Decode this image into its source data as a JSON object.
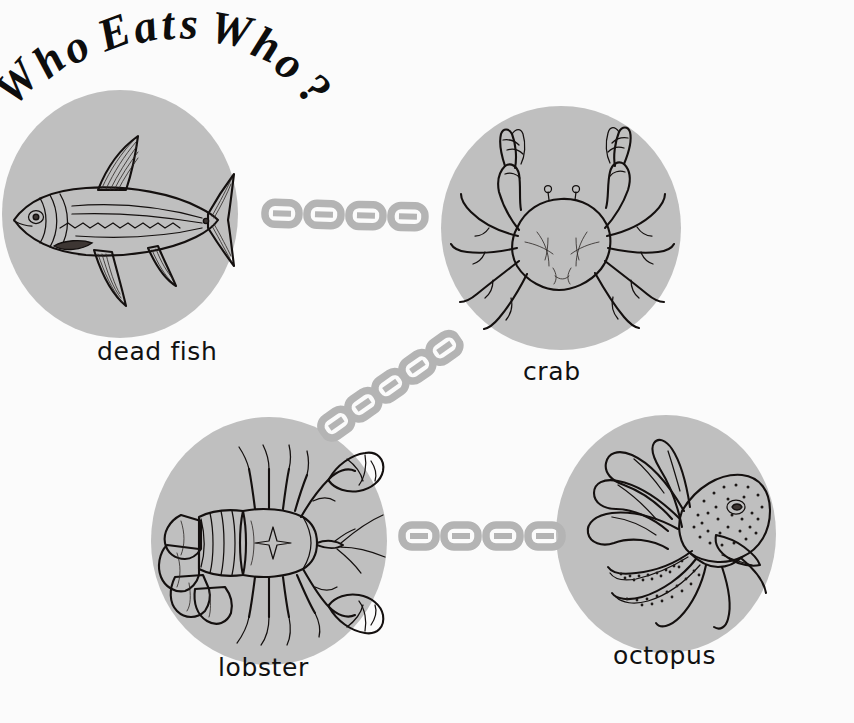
{
  "meta": {
    "kind": "food-chain-diagram",
    "canvas": {
      "width": 854,
      "height": 723
    },
    "background_color": "#fbfbfb",
    "blob_color": "#bfbfbf",
    "ink_color": "#14100f",
    "chain_color": "#b4b4b4"
  },
  "title": {
    "text": "Who Eats Who?",
    "letters": [
      "W",
      "h",
      "o",
      " ",
      "E",
      "a",
      "t",
      "s",
      " ",
      "W",
      "h",
      "o",
      "?"
    ],
    "style": "bold italic serif, arced upward"
  },
  "nodes": [
    {
      "id": "dead-fish",
      "label": "dead fish",
      "icon": "fish-illustration",
      "center": {
        "x": 120,
        "y": 214
      },
      "radius": {
        "x": 118,
        "y": 124
      },
      "label_pos": {
        "x": 97,
        "y": 352
      }
    },
    {
      "id": "crab",
      "label": "crab",
      "icon": "crab-illustration",
      "center": {
        "x": 561,
        "y": 228
      },
      "radius": {
        "x": 120,
        "y": 122
      },
      "label_pos": {
        "x": 523,
        "y": 372
      }
    },
    {
      "id": "lobster",
      "label": "lobster",
      "icon": "lobster-illustration",
      "center": {
        "x": 269,
        "y": 541
      },
      "radius": {
        "x": 118,
        "y": 124
      },
      "label_pos": {
        "x": 218,
        "y": 668
      }
    },
    {
      "id": "octopus",
      "label": "octopus",
      "icon": "octopus-illustration",
      "center": {
        "x": 666,
        "y": 534
      },
      "radius": {
        "x": 110,
        "y": 119
      },
      "label_pos": {
        "x": 613,
        "y": 656
      }
    }
  ],
  "connectors": [
    {
      "id": "fish-to-crab",
      "from": "dead-fish",
      "to": "crab",
      "icon": "chain-link",
      "links": 4,
      "start": {
        "x": 261,
        "y": 211
      },
      "end": {
        "x": 430,
        "y": 215
      }
    },
    {
      "id": "crab-to-lobster",
      "from": "crab",
      "to": "lobster",
      "icon": "chain-link",
      "links": 5,
      "start": {
        "x": 456,
        "y": 321
      },
      "end": {
        "x": 366,
        "y": 451
      }
    },
    {
      "id": "lobster-to-octopus",
      "from": "lobster",
      "to": "octopus",
      "icon": "chain-link",
      "links": 4,
      "start": {
        "x": 398,
        "y": 535
      },
      "end": {
        "x": 568,
        "y": 535
      }
    }
  ],
  "chain_data": {
    "order": [
      "dead fish",
      "crab",
      "lobster",
      "octopus"
    ],
    "relations": [
      {
        "eater": "crab",
        "eats": "dead fish"
      },
      {
        "eater": "lobster",
        "eats": "crab"
      },
      {
        "eater": "octopus",
        "eats": "lobster"
      }
    ]
  }
}
